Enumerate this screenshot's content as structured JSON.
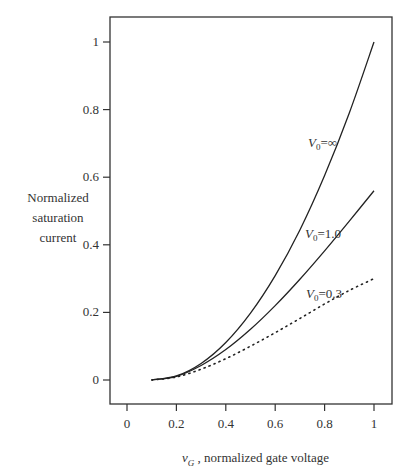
{
  "chart_data": {
    "type": "line",
    "title": "",
    "xlabel": "vG , normalized gate voltage",
    "xlabel_var": "v",
    "xlabel_sub": "G",
    "xlabel_rest": " , normalized gate voltage",
    "ylabel": "Normalized saturation current",
    "ylabel_lines": [
      "Normalized",
      "saturation",
      "current"
    ],
    "xlim": [
      -0.06,
      1.08
    ],
    "ylim": [
      -0.07,
      1.07
    ],
    "xticks": [
      0,
      0.2,
      0.4,
      0.6,
      0.8,
      1
    ],
    "xtick_labels": [
      "0",
      "0.2",
      "0.4",
      "0.6",
      "0.8",
      "1"
    ],
    "yticks": [
      0,
      0.2,
      0.4,
      0.6,
      0.8,
      1
    ],
    "ytick_labels": [
      "0",
      "0.2",
      "0.4",
      "0.6",
      "0.8",
      "1"
    ],
    "grid": false,
    "legend": "inline labels",
    "x": [
      0.1,
      0.2,
      0.3,
      0.4,
      0.5,
      0.6,
      0.7,
      0.8,
      0.9,
      1.0
    ],
    "series": [
      {
        "name": "V0=∞",
        "label_main": "V",
        "label_sub": "0",
        "label_rest": "=∞",
        "style": "solid",
        "values": [
          0.0,
          0.012,
          0.049,
          0.111,
          0.198,
          0.309,
          0.444,
          0.605,
          0.79,
          1.0
        ]
      },
      {
        "name": "V0=1.0",
        "label_main": "V",
        "label_sub": "0",
        "label_rest": "=1.0",
        "style": "solid",
        "values": [
          0.0,
          0.011,
          0.043,
          0.09,
          0.15,
          0.22,
          0.298,
          0.382,
          0.47,
          0.56
        ]
      },
      {
        "name": "V0=0.3",
        "label_main": "V",
        "label_sub": "0",
        "label_rest": "=0.3",
        "style": "dotted",
        "values": [
          0.0,
          0.009,
          0.032,
          0.063,
          0.1,
          0.14,
          0.182,
          0.225,
          0.265,
          0.3
        ]
      }
    ]
  }
}
